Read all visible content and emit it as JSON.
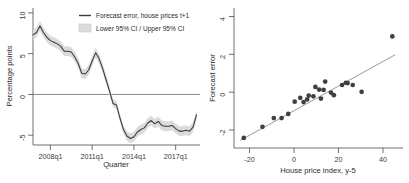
{
  "figure": {
    "panels": [
      "forecast-error-timeseries",
      "forecast-error-scatter"
    ]
  },
  "chart_data": [
    {
      "type": "line",
      "title": "",
      "xlabel": "Quarter",
      "ylabel": "Percentage points",
      "grid": false,
      "legend_position": "top-right",
      "xlim": [
        2006.75,
        2018.75
      ],
      "ylim": [
        -6.2,
        10.6
      ],
      "yticks": [
        10,
        5,
        0,
        -5
      ],
      "ytick_labels": [
        "10",
        "5",
        "0",
        "-5"
      ],
      "xticks": [
        2008.0,
        2011.0,
        2014.0,
        2017.0
      ],
      "xtick_labels": [
        "2008q1",
        "2011q1",
        "2014q1",
        "2017q1"
      ],
      "zero_reference_line": 0,
      "legend": [
        {
          "label": "Forecast error, house prices t+1",
          "marker": "line",
          "color": "#3a3a3a"
        },
        {
          "label": "Lower 95% CI / Upper 95% CI",
          "marker": "band",
          "color": "#dcdcdc"
        }
      ],
      "series": [
        {
          "name": "Forecast error, house prices t+1",
          "x": [
            2006.75,
            2007.0,
            2007.25,
            2007.5,
            2007.75,
            2008.0,
            2008.25,
            2008.5,
            2008.75,
            2009.0,
            2009.25,
            2009.5,
            2009.75,
            2010.0,
            2010.25,
            2010.5,
            2010.75,
            2011.0,
            2011.25,
            2011.5,
            2011.75,
            2012.0,
            2012.25,
            2012.5,
            2012.75,
            2013.0,
            2013.25,
            2013.5,
            2013.75,
            2014.0,
            2014.25,
            2014.5,
            2014.75,
            2015.0,
            2015.25,
            2015.5,
            2015.75,
            2016.0,
            2016.25,
            2016.5,
            2016.75,
            2017.0,
            2017.25,
            2017.5,
            2017.75,
            2018.0,
            2018.25,
            2018.5
          ],
          "values": [
            7.3,
            7.6,
            8.4,
            7.6,
            7.0,
            6.6,
            6.4,
            6.2,
            5.9,
            5.3,
            5.3,
            5.2,
            4.6,
            3.8,
            2.6,
            2.5,
            3.0,
            4.1,
            5.1,
            4.4,
            3.2,
            1.8,
            0.4,
            -1.1,
            -1.3,
            -2.9,
            -4.3,
            -5.1,
            -5.4,
            -5.2,
            -4.6,
            -4.3,
            -4.1,
            -3.5,
            -3.2,
            -3.6,
            -3.3,
            -3.8,
            -3.9,
            -3.9,
            -3.8,
            -4.2,
            -4.5,
            -4.5,
            -4.4,
            -4.5,
            -4.0,
            -2.5
          ]
        },
        {
          "name": "Lower 95% CI",
          "x": [
            2006.75,
            2007.0,
            2007.25,
            2007.5,
            2007.75,
            2008.0,
            2008.25,
            2008.5,
            2008.75,
            2009.0,
            2009.25,
            2009.5,
            2009.75,
            2010.0,
            2010.25,
            2010.5,
            2010.75,
            2011.0,
            2011.25,
            2011.5,
            2011.75,
            2012.0,
            2012.25,
            2012.5,
            2012.75,
            2013.0,
            2013.25,
            2013.5,
            2013.75,
            2014.0,
            2014.25,
            2014.5,
            2014.75,
            2015.0,
            2015.25,
            2015.5,
            2015.75,
            2016.0,
            2016.25,
            2016.5,
            2016.75,
            2017.0,
            2017.25,
            2017.5,
            2017.75,
            2018.0,
            2018.25,
            2018.5
          ],
          "values": [
            6.7,
            7.0,
            7.8,
            7.0,
            6.4,
            6.0,
            5.8,
            5.6,
            5.3,
            4.7,
            4.7,
            4.6,
            4.0,
            3.2,
            2.0,
            1.9,
            2.4,
            3.5,
            4.5,
            3.8,
            2.7,
            1.3,
            -0.1,
            -1.6,
            -1.8,
            -3.4,
            -4.8,
            -5.7,
            -6.0,
            -5.8,
            -5.2,
            -4.9,
            -4.7,
            -4.1,
            -3.8,
            -4.2,
            -3.9,
            -4.4,
            -4.5,
            -4.5,
            -4.4,
            -4.8,
            -5.1,
            -5.1,
            -5.0,
            -5.1,
            -4.6,
            -3.1
          ]
        },
        {
          "name": "Upper 95% CI",
          "x": [
            2006.75,
            2007.0,
            2007.25,
            2007.5,
            2007.75,
            2008.0,
            2008.25,
            2008.5,
            2008.75,
            2009.0,
            2009.25,
            2009.5,
            2009.75,
            2010.0,
            2010.25,
            2010.5,
            2010.75,
            2011.0,
            2011.25,
            2011.5,
            2011.75,
            2012.0,
            2012.25,
            2012.5,
            2012.75,
            2013.0,
            2013.25,
            2013.5,
            2013.75,
            2014.0,
            2014.25,
            2014.5,
            2014.75,
            2015.0,
            2015.25,
            2015.5,
            2015.75,
            2016.0,
            2016.25,
            2016.5,
            2016.75,
            2017.0,
            2017.25,
            2017.5,
            2017.75,
            2018.0,
            2018.25,
            2018.5
          ],
          "values": [
            7.9,
            8.2,
            9.0,
            8.2,
            7.6,
            7.2,
            7.0,
            6.8,
            6.5,
            5.9,
            5.9,
            5.8,
            5.2,
            4.4,
            3.2,
            3.1,
            3.6,
            4.7,
            5.7,
            5.0,
            3.8,
            2.4,
            1.0,
            -0.6,
            -0.8,
            -2.4,
            -3.8,
            -4.5,
            -4.8,
            -4.6,
            -4.0,
            -3.7,
            -3.5,
            -2.9,
            -2.6,
            -3.0,
            -2.7,
            -3.2,
            -3.3,
            -3.3,
            -3.2,
            -3.6,
            -3.9,
            -3.9,
            -3.8,
            -3.9,
            -3.4,
            -1.9
          ]
        }
      ]
    },
    {
      "type": "scatter",
      "title": "",
      "xlabel": "House price index, y-5",
      "ylabel": "Forecast error",
      "grid": false,
      "legend_position": "none",
      "xlim": [
        -27,
        49
      ],
      "ylim": [
        -2.95,
        4.45
      ],
      "yticks": [
        4,
        2,
        0,
        -2
      ],
      "ytick_labels": [
        "4",
        "2",
        "0",
        "-2"
      ],
      "xticks": [
        -20,
        0,
        20,
        40
      ],
      "xtick_labels": [
        "-20",
        "0",
        "20",
        "40"
      ],
      "points": [
        {
          "x": -22.6,
          "y": -2.42
        },
        {
          "x": -14.2,
          "y": -1.83
        },
        {
          "x": -9.1,
          "y": -1.37
        },
        {
          "x": -5.6,
          "y": -1.37
        },
        {
          "x": -2.6,
          "y": -1.15
        },
        {
          "x": 0.3,
          "y": -0.5
        },
        {
          "x": 2.8,
          "y": -0.3
        },
        {
          "x": 4.3,
          "y": -0.52
        },
        {
          "x": 5.9,
          "y": -0.38
        },
        {
          "x": 6.6,
          "y": -0.18
        },
        {
          "x": 8.7,
          "y": -0.22
        },
        {
          "x": 9.6,
          "y": 0.28
        },
        {
          "x": 11.3,
          "y": 0.14
        },
        {
          "x": 12.1,
          "y": -0.34
        },
        {
          "x": 13.3,
          "y": 0.12
        },
        {
          "x": 14.0,
          "y": 0.56
        },
        {
          "x": 16.6,
          "y": -0.02
        },
        {
          "x": 17.9,
          "y": -0.16
        },
        {
          "x": 21.6,
          "y": 0.38
        },
        {
          "x": 23.3,
          "y": 0.5
        },
        {
          "x": 24.1,
          "y": 0.48
        },
        {
          "x": 26.4,
          "y": 0.38
        },
        {
          "x": 30.4,
          "y": 0.02
        },
        {
          "x": 44.2,
          "y": 2.95
        }
      ],
      "fit_line": {
        "name": "linear-fit",
        "x": [
          -24.2,
          45.5
        ],
        "y": [
          -2.55,
          1.98
        ]
      }
    }
  ]
}
